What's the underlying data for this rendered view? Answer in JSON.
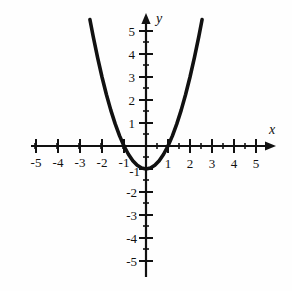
{
  "figure": {
    "background_color": "#fefefe",
    "ink_color": "#111111",
    "x_axis_name": "x",
    "y_axis_name": "y"
  },
  "chart_data": {
    "type": "line",
    "title": "",
    "subtitle": "",
    "xlabel": "x",
    "ylabel": "y",
    "xlim": [
      -5.6,
      5.6
    ],
    "ylim": [
      -5.6,
      5.6
    ],
    "grid": false,
    "legend": null,
    "equation": "y = x^2 - 1",
    "vertex": [
      0,
      -1
    ],
    "x_intercepts": [
      -1,
      1
    ],
    "y_intercept": -1,
    "x_tick_labels": [
      "-5",
      "-4",
      "-3",
      "-2",
      "-1",
      "1",
      "2",
      "3",
      "4",
      "5"
    ],
    "x_tick_values": [
      -5,
      -4,
      -3,
      -2,
      -1,
      1,
      2,
      3,
      4,
      5
    ],
    "y_tick_labels": [
      "5",
      "4",
      "3",
      "2",
      "1",
      "-1",
      "-2",
      "-3",
      "-4",
      "-5"
    ],
    "y_tick_values": [
      5,
      4,
      3,
      2,
      1,
      -1,
      -2,
      -3,
      -4,
      -5
    ],
    "minor_tick_step": 0.5,
    "major_tick_step": 1,
    "series": [
      {
        "name": "y = x^2 - 1",
        "x": [
          -2.55,
          -2.4,
          -2.2,
          -2.0,
          -1.8,
          -1.6,
          -1.4,
          -1.2,
          -1.0,
          -0.8,
          -0.6,
          -0.4,
          -0.2,
          0,
          0.2,
          0.4,
          0.6,
          0.8,
          1.0,
          1.2,
          1.4,
          1.6,
          1.8,
          2.0,
          2.2,
          2.4,
          2.55
        ],
        "y": [
          5.5,
          4.76,
          3.84,
          3.0,
          2.24,
          1.56,
          0.96,
          0.44,
          0.0,
          -0.36,
          -0.64,
          -0.84,
          -0.96,
          -1.0,
          -0.96,
          -0.84,
          -0.64,
          -0.36,
          0.0,
          0.44,
          0.96,
          1.56,
          2.24,
          3.0,
          3.84,
          4.76,
          5.5
        ]
      }
    ]
  }
}
